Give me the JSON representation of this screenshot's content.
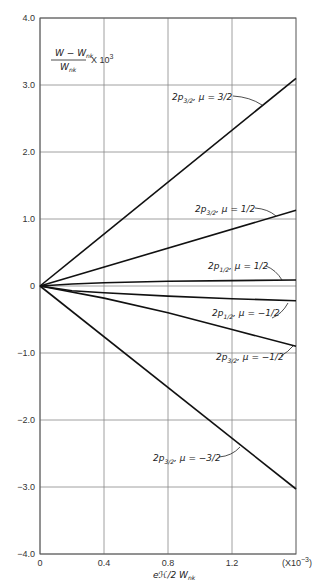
{
  "chart_data": {
    "type": "line",
    "title": "",
    "ylabel": "(W − W_nk) / W_nk × 10^3",
    "ylabel_parts": {
      "numerator": "W − W",
      "numerator_sub": "nk",
      "denominator": "W",
      "denominator_sub": "nk",
      "multiplier": "X 10",
      "multiplier_exp": "3"
    },
    "xlabel": "eℋ/2W_nk",
    "xlabel_parts": {
      "main": "eℋ/2 W",
      "sub": "nk"
    },
    "x_multiplier": "(X10",
    "x_multiplier_exp": "−3",
    "x_multiplier_close": ")",
    "xlim": [
      0,
      1.6
    ],
    "ylim": [
      -4.0,
      4.0
    ],
    "x_ticks": [
      "0",
      "0.4",
      "0.8",
      "1.2"
    ],
    "x_tick_values": [
      0,
      0.4,
      0.8,
      1.2
    ],
    "y_ticks": [
      "4.0",
      "3.0",
      "2.0",
      "1.0",
      "0",
      "-1.0",
      "-2.0",
      "-3.0",
      "-4.0"
    ],
    "y_tick_values": [
      4,
      3,
      2,
      1,
      0,
      -1,
      -2,
      -3,
      -4
    ],
    "grid": true,
    "legend": "inline annotations",
    "series": [
      {
        "name": "2p3/2, μ=3/2",
        "label_main": "2p",
        "label_sub": "3/2",
        "label_mu": ", μ = 3/2",
        "x": [
          0,
          1.6
        ],
        "values": [
          0,
          3.1
        ]
      },
      {
        "name": "2p3/2, μ=1/2",
        "label_main": "2p",
        "label_sub": "3/2",
        "label_mu": ", μ = 1/2",
        "x": [
          0,
          1.6
        ],
        "values": [
          0,
          1.13
        ]
      },
      {
        "name": "2p1/2, μ=1/2",
        "label_main": "2p",
        "label_sub": "1/2",
        "label_mu": ", μ = 1/2",
        "x": [
          0,
          0.2,
          0.4,
          0.8,
          1.2,
          1.6
        ],
        "values": [
          0,
          0.03,
          0.05,
          0.07,
          0.08,
          0.09
        ]
      },
      {
        "name": "2p1/2, μ=-1/2",
        "label_main": "2p",
        "label_sub": "1/2",
        "label_mu": ", μ = −1/2",
        "x": [
          0,
          0.2,
          0.4,
          0.8,
          1.2,
          1.6
        ],
        "values": [
          0,
          -0.07,
          -0.1,
          -0.15,
          -0.19,
          -0.22
        ]
      },
      {
        "name": "2p3/2, μ=-1/2",
        "label_main": "2p",
        "label_sub": "3/2",
        "label_mu": ", μ = −1/2",
        "x": [
          0,
          0.4,
          0.8,
          1.2,
          1.6
        ],
        "values": [
          0,
          -0.18,
          -0.4,
          -0.65,
          -0.9
        ]
      },
      {
        "name": "2p3/2, μ=-3/2",
        "label_main": "2p",
        "label_sub": "3/2",
        "label_mu": ", μ = −3/2",
        "x": [
          0,
          1.6
        ],
        "values": [
          0,
          -3.03
        ]
      }
    ]
  }
}
